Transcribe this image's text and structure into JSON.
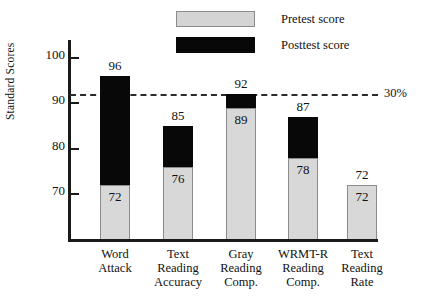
{
  "chart_data": {
    "type": "bar",
    "title": "",
    "subtitle": "",
    "xlabel": "",
    "ylabel": "Standard Scores",
    "categories": [
      "Word Attack",
      "Text Reading Accuracy",
      "Gray Reading Comp.",
      "WRMT-R Reading Comp.",
      "Text Reading Rate"
    ],
    "category_lines": [
      [
        "Word",
        "Attack"
      ],
      [
        "Text",
        "Reading",
        "Accuracy"
      ],
      [
        "Gray",
        "Reading",
        "Comp."
      ],
      [
        "WRMT-R",
        "Reading",
        "Comp."
      ],
      [
        "Text",
        "Reading",
        "Rate"
      ]
    ],
    "series": [
      {
        "name": "Pretest score",
        "color": "#d8d8d8",
        "values": [
          72,
          76,
          89,
          78,
          72
        ]
      },
      {
        "name": "Posttest score",
        "color": "#080808",
        "values": [
          96,
          85,
          92,
          87,
          72
        ]
      }
    ],
    "yticks": [
      70,
      80,
      90,
      100
    ],
    "ytick_labels": [
      "70",
      "80",
      "90",
      "100"
    ],
    "ylim": [
      60,
      104
    ],
    "grid": false,
    "legend_position": "top-center",
    "annotations": [
      {
        "name": "threshold-line",
        "label": "30%",
        "value": 92,
        "style": "dashed"
      }
    ]
  },
  "legend": {
    "items": [
      {
        "label": "Pretest score",
        "swatch": "pretest-swatch"
      },
      {
        "label": "Posttest score",
        "swatch": "posttest-swatch"
      }
    ]
  },
  "bar_labels": {
    "top": [
      "96",
      "85",
      "92",
      "87",
      "72"
    ],
    "inside": [
      "72",
      "76",
      "89",
      "78",
      "72"
    ]
  }
}
